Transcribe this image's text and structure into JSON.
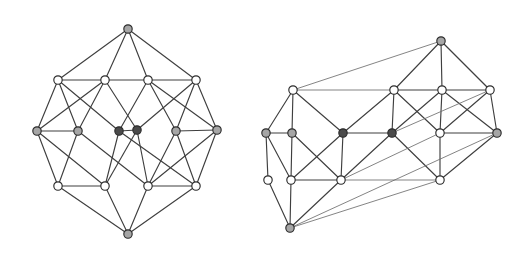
{
  "figure": {
    "background_color": "#ffffff",
    "caption": "",
    "panel_count": 2
  },
  "palette": {
    "edge_color": "#3f3f3f",
    "edge_thin_color": "#6e6e6e",
    "vertex_outline": "#2b2b2b",
    "vertex_white": "#ffffff",
    "vertex_gray": "#a6a6a6",
    "vertex_dark": "#4a4a4a"
  },
  "chart_data": {
    "type": "diagram",
    "xlabel": "",
    "ylabel": "",
    "graphs": [
      {
        "name": "left-graph",
        "label": "left",
        "vertex_count": 16,
        "edge_count": 40,
        "vertices": [
          {
            "id": "L0",
            "x": 128,
            "y": 29,
            "fill": "gray"
          },
          {
            "id": "L1",
            "x": 58,
            "y": 80,
            "fill": "white"
          },
          {
            "id": "L2",
            "x": 105,
            "y": 80,
            "fill": "white"
          },
          {
            "id": "L3",
            "x": 148,
            "y": 80,
            "fill": "white"
          },
          {
            "id": "L4",
            "x": 196,
            "y": 80,
            "fill": "white"
          },
          {
            "id": "L5",
            "x": 37,
            "y": 131,
            "fill": "gray"
          },
          {
            "id": "L6",
            "x": 78,
            "y": 131,
            "fill": "gray"
          },
          {
            "id": "L7",
            "x": 119,
            "y": 131,
            "fill": "dark"
          },
          {
            "id": "L8",
            "x": 137,
            "y": 130,
            "fill": "dark"
          },
          {
            "id": "L9",
            "x": 176,
            "y": 131,
            "fill": "gray"
          },
          {
            "id": "L10",
            "x": 217,
            "y": 130,
            "fill": "gray"
          },
          {
            "id": "L11",
            "x": 58,
            "y": 186,
            "fill": "white"
          },
          {
            "id": "L12",
            "x": 105,
            "y": 186,
            "fill": "white"
          },
          {
            "id": "L13",
            "x": 148,
            "y": 186,
            "fill": "white"
          },
          {
            "id": "L14",
            "x": 196,
            "y": 186,
            "fill": "white"
          },
          {
            "id": "L15",
            "x": 128,
            "y": 234,
            "fill": "gray"
          }
        ],
        "edges": [
          [
            "L0",
            "L1"
          ],
          [
            "L0",
            "L2"
          ],
          [
            "L0",
            "L3"
          ],
          [
            "L0",
            "L4"
          ],
          [
            "L1",
            "L5"
          ],
          [
            "L1",
            "L6"
          ],
          [
            "L1",
            "L7"
          ],
          [
            "L2",
            "L5"
          ],
          [
            "L2",
            "L6"
          ],
          [
            "L2",
            "L8"
          ],
          [
            "L3",
            "L7"
          ],
          [
            "L3",
            "L9"
          ],
          [
            "L3",
            "L10"
          ],
          [
            "L4",
            "L8"
          ],
          [
            "L4",
            "L9"
          ],
          [
            "L4",
            "L10"
          ],
          [
            "L5",
            "L11"
          ],
          [
            "L5",
            "L12"
          ],
          [
            "L6",
            "L11"
          ],
          [
            "L6",
            "L13"
          ],
          [
            "L7",
            "L12"
          ],
          [
            "L7",
            "L14"
          ],
          [
            "L8",
            "L13"
          ],
          [
            "L8",
            "L12"
          ],
          [
            "L9",
            "L13"
          ],
          [
            "L9",
            "L14"
          ],
          [
            "L10",
            "L14"
          ],
          [
            "L10",
            "L13"
          ],
          [
            "L11",
            "L15"
          ],
          [
            "L12",
            "L15"
          ],
          [
            "L13",
            "L15"
          ],
          [
            "L14",
            "L15"
          ],
          [
            "L1",
            "L2"
          ],
          [
            "L3",
            "L4"
          ],
          [
            "L11",
            "L12"
          ],
          [
            "L13",
            "L14"
          ],
          [
            "L5",
            "L6"
          ],
          [
            "L9",
            "L10"
          ],
          [
            "L7",
            "L8"
          ],
          [
            "L2",
            "L3"
          ]
        ]
      },
      {
        "name": "right-graph",
        "label": "right",
        "vertex_count": 16,
        "edge_count": 40,
        "vertices": [
          {
            "id": "R0",
            "x": 441,
            "y": 41,
            "fill": "gray"
          },
          {
            "id": "R1",
            "x": 293,
            "y": 90,
            "fill": "white"
          },
          {
            "id": "R2",
            "x": 394,
            "y": 90,
            "fill": "white"
          },
          {
            "id": "R3",
            "x": 442,
            "y": 90,
            "fill": "white"
          },
          {
            "id": "R4",
            "x": 490,
            "y": 90,
            "fill": "white"
          },
          {
            "id": "R5",
            "x": 266,
            "y": 133,
            "fill": "gray"
          },
          {
            "id": "R6",
            "x": 292,
            "y": 133,
            "fill": "gray"
          },
          {
            "id": "R7",
            "x": 343,
            "y": 133,
            "fill": "dark"
          },
          {
            "id": "R8",
            "x": 392,
            "y": 133,
            "fill": "dark"
          },
          {
            "id": "R9",
            "x": 440,
            "y": 133,
            "fill": "white"
          },
          {
            "id": "R10",
            "x": 497,
            "y": 133,
            "fill": "gray"
          },
          {
            "id": "R11",
            "x": 291,
            "y": 180,
            "fill": "white"
          },
          {
            "id": "R12",
            "x": 341,
            "y": 180,
            "fill": "white"
          },
          {
            "id": "R13",
            "x": 440,
            "y": 180,
            "fill": "white"
          },
          {
            "id": "R14",
            "x": 290,
            "y": 228,
            "fill": "gray"
          },
          {
            "id": "R15",
            "x": 268,
            "y": 180,
            "fill": "white"
          }
        ],
        "edges": [
          [
            "R0",
            "R2"
          ],
          [
            "R0",
            "R3"
          ],
          [
            "R0",
            "R4"
          ],
          [
            "R0",
            "R1"
          ],
          [
            "R1",
            "R5"
          ],
          [
            "R1",
            "R6"
          ],
          [
            "R1",
            "R7"
          ],
          [
            "R2",
            "R7"
          ],
          [
            "R2",
            "R8"
          ],
          [
            "R2",
            "R9"
          ],
          [
            "R3",
            "R8"
          ],
          [
            "R3",
            "R9"
          ],
          [
            "R3",
            "R10"
          ],
          [
            "R4",
            "R9"
          ],
          [
            "R4",
            "R10"
          ],
          [
            "R4",
            "R8"
          ],
          [
            "R5",
            "R11"
          ],
          [
            "R5",
            "R15"
          ],
          [
            "R6",
            "R11"
          ],
          [
            "R6",
            "R12"
          ],
          [
            "R7",
            "R12"
          ],
          [
            "R7",
            "R11"
          ],
          [
            "R8",
            "R12"
          ],
          [
            "R8",
            "R13"
          ],
          [
            "R9",
            "R13"
          ],
          [
            "R9",
            "R12"
          ],
          [
            "R10",
            "R13"
          ],
          [
            "R10",
            "R14"
          ],
          [
            "R11",
            "R14"
          ],
          [
            "R12",
            "R14"
          ],
          [
            "R13",
            "R14"
          ],
          [
            "R15",
            "R14"
          ],
          [
            "R1",
            "R2"
          ],
          [
            "R3",
            "R4"
          ],
          [
            "R11",
            "R12"
          ],
          [
            "R5",
            "R6"
          ],
          [
            "R9",
            "R10"
          ],
          [
            "R7",
            "R8"
          ],
          [
            "R2",
            "R3"
          ],
          [
            "R12",
            "R13"
          ]
        ]
      }
    ]
  }
}
